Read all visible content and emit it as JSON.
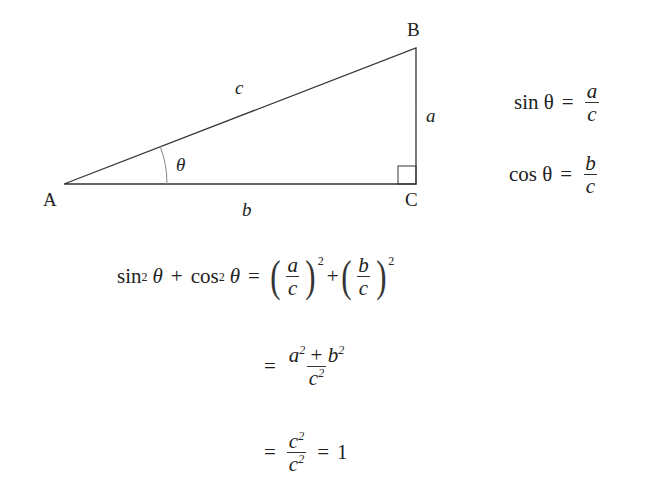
{
  "diagram": {
    "vertices": {
      "A": "A",
      "B": "B",
      "C": "C"
    },
    "sides": {
      "hypotenuse": "c",
      "opposite": "a",
      "adjacent": "b"
    },
    "angle": "θ",
    "right_angle_at": "C"
  },
  "definitions": {
    "sin": {
      "lhs": "sin θ",
      "eq": "=",
      "num": "a",
      "den": "c"
    },
    "cos": {
      "lhs": "cos θ",
      "eq": "=",
      "num": "b",
      "den": "c"
    }
  },
  "derivation": {
    "line1": {
      "lhs_sin": "sin",
      "lhs_sin_exp": "2",
      "lhs_theta1": "θ",
      "plus": "+",
      "lhs_cos": "cos",
      "lhs_cos_exp": "2",
      "lhs_theta2": "θ",
      "eq": "=",
      "f1_num": "a",
      "f1_den": "c",
      "f1_exp": "2",
      "plus2": "+",
      "f2_num": "b",
      "f2_den": "c",
      "f2_exp": "2"
    },
    "line2": {
      "eq": "=",
      "num_a": "a",
      "num_a_exp": "2",
      "plus": "+",
      "num_b": "b",
      "num_b_exp": "2",
      "den": "c",
      "den_exp": "2"
    },
    "line3": {
      "eq": "=",
      "num": "c",
      "num_exp": "2",
      "den": "c",
      "den_exp": "2",
      "eq2": "=",
      "result": "1"
    }
  },
  "colors": {
    "line": "#333333",
    "arc": "#888888",
    "background": "#ffffff"
  }
}
